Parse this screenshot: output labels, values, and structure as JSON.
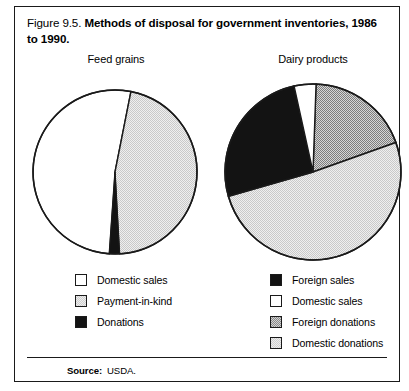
{
  "figure": {
    "number": "Figure 9.5.",
    "title": "Methods of disposal for government inventories, 1986 to 1990.",
    "source_label": "Source:",
    "source_value": "USDA."
  },
  "colors": {
    "white": "#ffffff",
    "black": "#131313",
    "light_gray": "#e6e6e6",
    "medium_gray": "#b0b0b0",
    "outline": "#1a1a1a"
  },
  "chart_data": [
    {
      "type": "pie",
      "title": "Feed grains",
      "categories": [
        "Domestic sales",
        "Payment-in-kind",
        "Donations"
      ],
      "values": [
        52,
        46,
        2
      ],
      "legend_position": "bottom-left",
      "slice_fills": [
        "white",
        "light_gray",
        "black"
      ]
    },
    {
      "type": "pie",
      "title": "Dairy products",
      "categories": [
        "Foreign sales",
        "Domestic sales",
        "Foreign donations",
        "Domestic donations"
      ],
      "values": [
        26,
        4,
        19,
        51
      ],
      "legend_position": "bottom-right",
      "slice_fills": [
        "black",
        "white",
        "medium_gray",
        "light_gray"
      ]
    }
  ],
  "legend_left": {
    "items": [
      {
        "label": "Domestic sales",
        "fill": "white"
      },
      {
        "label": "Payment-in-kind",
        "fill": "light_gray"
      },
      {
        "label": "Donations",
        "fill": "black"
      }
    ]
  },
  "legend_right": {
    "items": [
      {
        "label": "Foreign sales",
        "fill": "black"
      },
      {
        "label": "Domestic sales",
        "fill": "white"
      },
      {
        "label": "Foreign donations",
        "fill": "medium_gray"
      },
      {
        "label": "Domestic donations",
        "fill": "light_gray"
      }
    ]
  }
}
